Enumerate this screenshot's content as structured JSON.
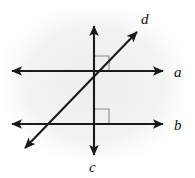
{
  "figure": {
    "canvas": {
      "width": 195,
      "height": 178
    },
    "background_color": "#ffffff",
    "shade_color": "#f1f1f1",
    "stroke_color": "#1a1a1a",
    "marker_color": "#8a8a8a",
    "lines": [
      {
        "id": "a",
        "label": "a",
        "kind": "horizontal",
        "double_arrow": true,
        "x1": 12,
        "y1": 71,
        "x2": 163,
        "y2": 71,
        "label_x": 174,
        "label_y": 77
      },
      {
        "id": "b",
        "label": "b",
        "kind": "horizontal",
        "double_arrow": true,
        "x1": 12,
        "y1": 124,
        "x2": 163,
        "y2": 124,
        "label_x": 174,
        "label_y": 130
      },
      {
        "id": "c",
        "label": "c",
        "kind": "vertical",
        "double_arrow": true,
        "x1": 94,
        "y1": 26,
        "x2": 94,
        "y2": 155,
        "label_x": 89,
        "label_y": 172
      },
      {
        "id": "d",
        "label": "d",
        "kind": "diagonal",
        "double_arrow": true,
        "x1": 25,
        "y1": 148,
        "x2": 137,
        "y2": 32,
        "label_x": 141,
        "label_y": 24
      }
    ],
    "right_angle_markers": [
      {
        "id": "upper",
        "x": 94,
        "y": 56,
        "size": 15,
        "corner": "bottom-left",
        "between": "line c and line d above line a"
      },
      {
        "id": "lower",
        "x": 94,
        "y": 109,
        "size": 15,
        "corner": "bottom-left",
        "between": "line c and line b"
      }
    ],
    "intersections": [
      {
        "id": "c-a-d",
        "x": 94,
        "y": 71,
        "lines": [
          "a",
          "c",
          "d"
        ]
      },
      {
        "id": "c-b",
        "x": 94,
        "y": 124,
        "lines": [
          "b",
          "c"
        ]
      },
      {
        "id": "d-b",
        "x": 44,
        "y": 124,
        "lines": [
          "b",
          "d"
        ]
      }
    ]
  }
}
